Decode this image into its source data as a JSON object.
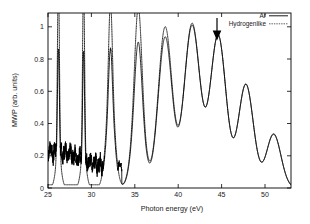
{
  "chart_data": {
    "type": "line",
    "title": "",
    "xlabel": "Photon energy (eV)",
    "ylabel": "MWP (arb. units)",
    "xlim": [
      25,
      53
    ],
    "ylim": [
      0,
      1.08
    ],
    "xticks": [
      25,
      30,
      35,
      40,
      45,
      50
    ],
    "yticks": [
      0,
      0.2,
      0.4,
      0.6,
      0.8,
      1
    ],
    "xtick_labels": [
      "25",
      "30",
      "35",
      "40",
      "45",
      "50"
    ],
    "ytick_labels": [
      "0",
      "0.2",
      "0.4",
      "0.6",
      "0.8",
      "1"
    ],
    "grid": false,
    "legend_position": "top-right",
    "legend": [
      {
        "name": "Ar",
        "style": "solid"
      },
      {
        "name": "Hydrogenlike",
        "style": "dotted"
      }
    ],
    "annotations": [
      {
        "type": "arrow",
        "x": 44.5,
        "y_tip": 0.96,
        "y_tail": 1.07,
        "direction": "down",
        "label": ""
      }
    ],
    "harmonic_peaks_eV": [
      26.2,
      29.1,
      32.2,
      35.4,
      38.5,
      41.6,
      44.6,
      47.8,
      51.0
    ],
    "series": [
      {
        "name": "Ar",
        "style": "solid",
        "peak_values": [
          0.86,
          0.84,
          0.86,
          0.9,
          0.93,
          1.0,
          0.94,
          0.64,
          0.33
        ]
      },
      {
        "name": "Hydrogenlike",
        "style": "dotted",
        "peak_values": [
          1.08,
          1.08,
          1.03,
          1.0,
          0.98,
          1.0,
          0.93,
          0.63,
          0.33
        ]
      }
    ]
  },
  "axes": {
    "x_title": "Photon energy (eV)",
    "y_title": "MWP (arb. units)"
  },
  "legend": {
    "entry_ar": "Ar",
    "entry_hydrogenlike": "Hydrogenlike"
  },
  "ticks": {
    "x": [
      "25",
      "30",
      "35",
      "40",
      "45",
      "50"
    ],
    "y": [
      "0",
      "0.2",
      "0.4",
      "0.6",
      "0.8",
      "1"
    ]
  },
  "colors": {
    "foreground": "#000000",
    "background": "#ffffff"
  }
}
